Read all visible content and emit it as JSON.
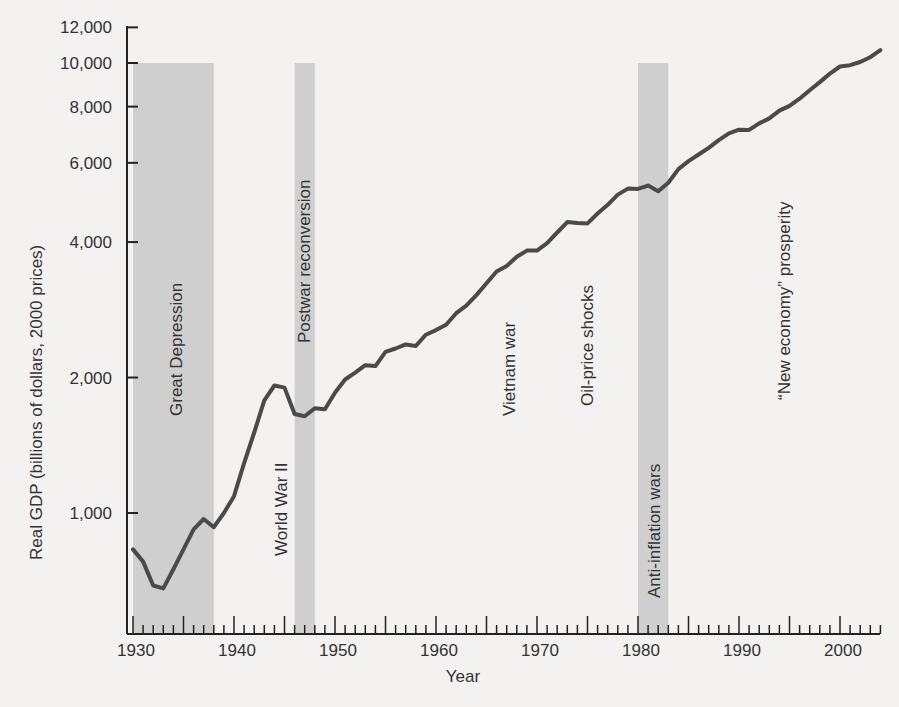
{
  "chart_data": {
    "type": "line",
    "title": "",
    "xlabel": "Year",
    "ylabel": "Real GDP (billions of dollars, 2000 prices)",
    "y_scale": "log",
    "ylim": [
      560,
      12000
    ],
    "xlim": [
      1930,
      2004
    ],
    "grid": false,
    "legend": null,
    "y_ticks": [
      {
        "value": 1000,
        "label": "1,000"
      },
      {
        "value": 2000,
        "label": "2,000"
      },
      {
        "value": 4000,
        "label": "4,000"
      },
      {
        "value": 6000,
        "label": "6,000"
      },
      {
        "value": 8000,
        "label": "8,000"
      },
      {
        "value": 10000,
        "label": "10,000"
      },
      {
        "value": 12000,
        "label": "12,000"
      }
    ],
    "x_ticks": [
      {
        "value": 1930,
        "label": "1930"
      },
      {
        "value": 1940,
        "label": "1940"
      },
      {
        "value": 1950,
        "label": "1950"
      },
      {
        "value": 1960,
        "label": "1960"
      },
      {
        "value": 1970,
        "label": "1970"
      },
      {
        "value": 1980,
        "label": "1980"
      },
      {
        "value": 1990,
        "label": "1990"
      },
      {
        "value": 2000,
        "label": "2000"
      }
    ],
    "series": [
      {
        "name": "Real GDP",
        "color": "#4a4a4a",
        "x": [
          1930,
          1931,
          1932,
          1933,
          1934,
          1935,
          1936,
          1937,
          1938,
          1939,
          1940,
          1941,
          1942,
          1943,
          1944,
          1945,
          1946,
          1947,
          1948,
          1949,
          1950,
          1951,
          1952,
          1953,
          1954,
          1955,
          1956,
          1957,
          1958,
          1959,
          1960,
          1961,
          1962,
          1963,
          1964,
          1965,
          1966,
          1967,
          1968,
          1969,
          1970,
          1971,
          1972,
          1973,
          1974,
          1975,
          1976,
          1977,
          1978,
          1979,
          1980,
          1981,
          1982,
          1983,
          1984,
          1985,
          1986,
          1987,
          1988,
          1989,
          1990,
          1991,
          1992,
          1993,
          1994,
          1995,
          1996,
          1997,
          1998,
          1999,
          2000,
          2001,
          2002,
          2003,
          2004
        ],
        "values": [
          830,
          780,
          690,
          680,
          750,
          830,
          920,
          970,
          930,
          1000,
          1090,
          1290,
          1510,
          1780,
          1920,
          1900,
          1660,
          1640,
          1710,
          1700,
          1850,
          1980,
          2050,
          2130,
          2120,
          2280,
          2320,
          2370,
          2350,
          2490,
          2550,
          2620,
          2780,
          2890,
          3050,
          3240,
          3440,
          3540,
          3710,
          3830,
          3830,
          3980,
          4200,
          4430,
          4410,
          4400,
          4630,
          4840,
          5100,
          5260,
          5250,
          5340,
          5190,
          5420,
          5810,
          6050,
          6260,
          6480,
          6740,
          6980,
          7110,
          7100,
          7340,
          7530,
          7840,
          8030,
          8330,
          8700,
          9070,
          9470,
          9820,
          9890,
          10050,
          10300,
          10680
        ]
      }
    ],
    "shaded_periods": [
      {
        "label": "Great Depression",
        "start": 1930,
        "end": 1938
      },
      {
        "label": "Postwar reconversion",
        "start": 1946,
        "end": 1948
      },
      {
        "label": "Anti-inflation wars",
        "start": 1980,
        "end": 1983
      }
    ],
    "annotations": [
      {
        "label": "World War II",
        "year": 1944
      },
      {
        "label": "Vietnam war",
        "year": 1968
      },
      {
        "label": "Oil-price shocks",
        "year": 1976
      },
      {
        "label": "“New economy” prosperity",
        "year": 1995
      }
    ]
  },
  "labels": {
    "y_axis_title": "Real GDP (billions of dollars, 2000 prices)",
    "x_axis_title": "Year",
    "great_depression": "Great Depression",
    "postwar": "Postwar reconversion",
    "ww2": "World War II",
    "vietnam": "Vietnam war",
    "oil": "Oil-price shocks",
    "anti_inflation": "Anti-inflation wars",
    "new_economy": "“New economy” prosperity"
  },
  "colors": {
    "band": "#cfcfcf",
    "line": "#4a4a4a",
    "axis": "#222222"
  }
}
